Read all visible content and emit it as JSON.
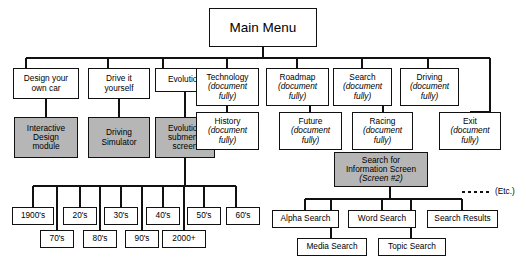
{
  "diagram": {
    "title_node": {
      "label": "Main Menu"
    },
    "etc_label": "(Etc.)",
    "doc_note": "(document\nfully)",
    "top_level": [
      {
        "id": "design",
        "label": "Design your\nown car",
        "sub": ""
      },
      {
        "id": "drive",
        "label": "Drive it\nyourself",
        "sub": ""
      },
      {
        "id": "evolution",
        "label": "Evolution",
        "sub": ""
      },
      {
        "id": "technology",
        "label": "Technology",
        "sub": "(document\nfully)"
      },
      {
        "id": "roadmap",
        "label": "Roadmap",
        "sub": "(document\nfully)"
      },
      {
        "id": "search",
        "label": "Search",
        "sub": "(document\nfully)"
      },
      {
        "id": "driving",
        "label": "Driving",
        "sub": "(document\nfully)"
      }
    ],
    "second_level": [
      {
        "id": "interactive",
        "label": "Interactive\nDesign\nmodule",
        "sub": "",
        "shaded": true
      },
      {
        "id": "simulator",
        "label": "Driving\nSimulator",
        "sub": "",
        "shaded": true
      },
      {
        "id": "evosub",
        "label": "Evolution\nsubmenu\nscreen",
        "sub": "",
        "shaded": true
      },
      {
        "id": "history",
        "label": "History",
        "sub": "(document\nfully)",
        "shaded": false
      },
      {
        "id": "future",
        "label": "Future",
        "sub": "(document\nfully)",
        "shaded": false
      },
      {
        "id": "racing",
        "label": "Racing",
        "sub": "(document\nfully)",
        "shaded": false
      },
      {
        "id": "exit",
        "label": "Exit",
        "sub": "(document\nfully)",
        "shaded": false
      }
    ],
    "search_screen": {
      "label": "Search for\nInformation Screen",
      "sub": "(Screen #2)",
      "shaded": true
    },
    "decades_upper": [
      {
        "id": "d1900",
        "label": "1900's"
      },
      {
        "id": "d20",
        "label": "20's"
      },
      {
        "id": "d30",
        "label": "30's"
      },
      {
        "id": "d40",
        "label": "40's"
      },
      {
        "id": "d50",
        "label": "50's"
      },
      {
        "id": "d60",
        "label": "60's"
      }
    ],
    "decades_lower": [
      {
        "id": "d70",
        "label": "70's"
      },
      {
        "id": "d80",
        "label": "80's"
      },
      {
        "id": "d90",
        "label": "90's"
      },
      {
        "id": "d2000",
        "label": "2000+"
      }
    ],
    "search_children_upper": [
      {
        "id": "alpha",
        "label": "Alpha Search"
      },
      {
        "id": "word",
        "label": "Word Search"
      },
      {
        "id": "results",
        "label": "Search Results"
      }
    ],
    "search_children_lower": [
      {
        "id": "media",
        "label": "Media Search"
      },
      {
        "id": "topic",
        "label": "Topic Search"
      }
    ],
    "colors": {
      "line": "#111111",
      "shaded_fill": "#b6b6b6",
      "page_bg": "#ffffff"
    }
  }
}
